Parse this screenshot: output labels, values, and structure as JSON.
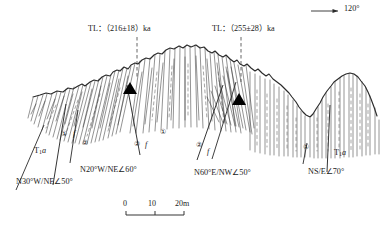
{
  "figure": {
    "type": "geological-cross-section",
    "background_color": "#ffffff",
    "line_color": "#2a2a2a",
    "sample_marker_color": "#000000"
  },
  "azimuth_indicator": {
    "label": "120°",
    "arrow_direction": "right",
    "icon": "arrow-right-icon"
  },
  "dating_labels": [
    {
      "id": "tl-west",
      "prefix": "TL：",
      "value": "（216±18）",
      "unit": "ka",
      "full": "TL：（216±18）ka"
    },
    {
      "id": "tl-east",
      "prefix": "TL：",
      "value": "（255±28）",
      "unit": "ka",
      "full": "TL：（255±28）ka"
    }
  ],
  "attitude_labels": [
    {
      "id": "att-1",
      "text": "N30°W/NE∠50°",
      "strike": "N30°W",
      "dip_dir": "NE",
      "dip": "50°"
    },
    {
      "id": "att-2",
      "text": "N20°W/NE∠60°",
      "strike": "N20°W",
      "dip_dir": "NE",
      "dip": "60°"
    },
    {
      "id": "att-3",
      "text": "N60°E/NW∠50°",
      "strike": "N60°E",
      "dip_dir": "NW",
      "dip": "50°"
    },
    {
      "id": "att-4",
      "text": "NS/E∠70°",
      "strike": "NS",
      "dip_dir": "E",
      "dip": "70°"
    }
  ],
  "formation_labels": [
    {
      "id": "fm-left",
      "code": "T",
      "subscript": "1",
      "suffix": "a"
    },
    {
      "id": "fm-right",
      "code": "T",
      "subscript": "1",
      "suffix": "a"
    }
  ],
  "unit_markers": [
    {
      "id": "u1-left",
      "label": "①"
    },
    {
      "id": "u2-left",
      "label": "②"
    },
    {
      "id": "u2-mid",
      "label": "②"
    },
    {
      "id": "u1-mid",
      "label": "①"
    },
    {
      "id": "u2-right",
      "label": "②"
    },
    {
      "id": "u1-far-right",
      "label": "①"
    }
  ],
  "fault_markers": [
    {
      "id": "f-left",
      "label": "f"
    },
    {
      "id": "f-mid",
      "label": "f"
    },
    {
      "id": "f-right",
      "label": "f"
    }
  ],
  "sample_points": [
    {
      "id": "sample-west",
      "marker": "filled-triangle"
    },
    {
      "id": "sample-east",
      "marker": "filled-triangle"
    }
  ],
  "scale_bar": {
    "ticks": [
      "0",
      "10",
      "20m"
    ],
    "unit": "m",
    "length_m": 20
  }
}
